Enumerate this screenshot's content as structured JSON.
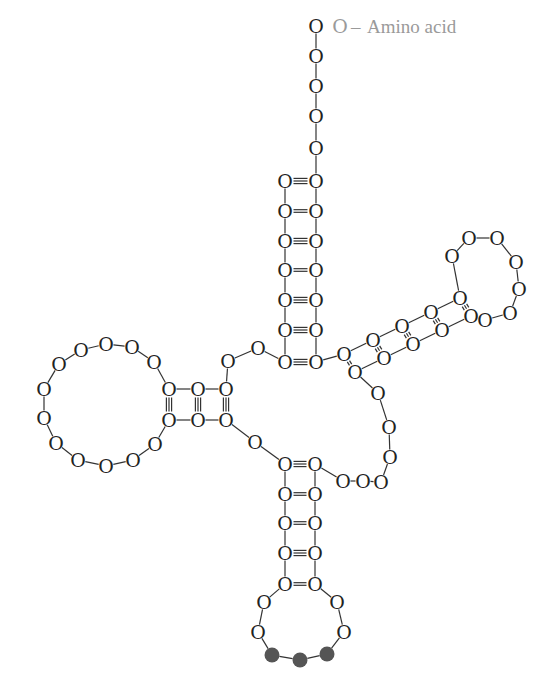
{
  "labels": {
    "amino_acid": "Amino acid",
    "nucleotide_glyph": "O",
    "bond_dash": "–"
  },
  "colors": {
    "nucleotide": "#222222",
    "terminal_nucleotide": "#9a9a9a",
    "amino_acid_label": "#9a9a9a",
    "anticodon": "#555555"
  },
  "structure": {
    "acceptor_stem": {
      "unpaired_3prime_nucleotides": 5,
      "base_pairs": [
        "triple",
        "double",
        "triple",
        "double",
        "triple",
        "triple",
        "triple"
      ]
    },
    "d_arm": {
      "base_pairs": [
        "triple",
        "triple",
        "triple"
      ],
      "loop_nucleotides": 14
    },
    "t_arm": {
      "base_pairs": [
        "triple",
        "triple",
        "triple",
        "triple",
        "double"
      ],
      "loop_nucleotides": 8
    },
    "anticodon_arm": {
      "base_pairs": [
        "triple",
        "double",
        "double",
        "triple",
        "double"
      ],
      "loop_nucleotides": 7,
      "anticodon_positions": 3
    },
    "variable_loop_nucleotides": 6
  }
}
